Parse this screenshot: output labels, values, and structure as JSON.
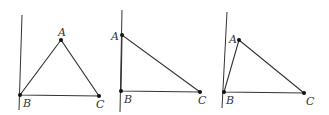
{
  "figures": [
    {
      "id": "figure-1",
      "axis": {
        "x1": 22,
        "y1": 15,
        "x2": 19,
        "y2": 110
      },
      "points": {
        "A": {
          "x": 61,
          "y": 40,
          "label": "A",
          "lx": 58,
          "ly": 36
        },
        "B": {
          "x": 20,
          "y": 95,
          "label": "B",
          "lx": 23,
          "ly": 107
        },
        "C": {
          "x": 99,
          "y": 96,
          "label": "C",
          "lx": 96,
          "ly": 108
        }
      }
    },
    {
      "id": "figure-2",
      "axis": {
        "x1": 122,
        "y1": 10,
        "x2": 120,
        "y2": 112
      },
      "points": {
        "A": {
          "x": 122,
          "y": 35,
          "label": "A",
          "lx": 111,
          "ly": 40
        },
        "B": {
          "x": 121,
          "y": 91,
          "label": "B",
          "lx": 124,
          "ly": 103
        },
        "C": {
          "x": 200,
          "y": 92,
          "label": "C",
          "lx": 198,
          "ly": 104
        }
      }
    },
    {
      "id": "figure-3",
      "axis": {
        "x1": 227,
        "y1": 12,
        "x2": 222,
        "y2": 108
      },
      "points": {
        "A": {
          "x": 239,
          "y": 40,
          "label": "A",
          "lx": 229,
          "ly": 43
        },
        "B": {
          "x": 224,
          "y": 92,
          "label": "B",
          "lx": 226,
          "ly": 104
        },
        "C": {
          "x": 304,
          "y": 93,
          "label": "C",
          "lx": 306,
          "ly": 105
        }
      }
    }
  ],
  "style": {
    "stroke": "#333333",
    "point_fill": "#111111"
  }
}
